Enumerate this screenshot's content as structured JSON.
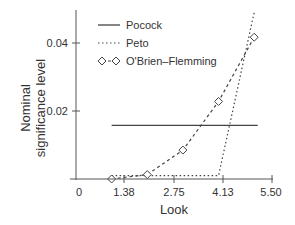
{
  "chart_data": {
    "type": "line",
    "title": "",
    "xlabel": "Look",
    "ylabel": "Nominal significance level",
    "ylabel_lines": [
      "Nominal",
      "significance level"
    ],
    "xlim": [
      0,
      5.5
    ],
    "ylim": [
      0,
      0.05
    ],
    "x_ticks": [
      0,
      1.375,
      2.75,
      4.125,
      5.5
    ],
    "x_tick_labels": [
      "0",
      "1.38",
      "2.75",
      "4.13",
      "5.50"
    ],
    "y_ticks": [
      0.02,
      0.04
    ],
    "y_tick_labels": [
      "0.02",
      "0.04"
    ],
    "grid": false,
    "legend_position": "upper-left-inside",
    "x": [
      1,
      2,
      3,
      4,
      5
    ],
    "series": [
      {
        "name": "Pocock",
        "style": "solid",
        "marker": "none",
        "values": [
          0.0158,
          0.0158,
          0.0158,
          0.0158,
          0.0158
        ]
      },
      {
        "name": "Peto",
        "style": "dotted",
        "marker": "none",
        "values": [
          0.001,
          0.001,
          0.001,
          0.001,
          0.049
        ]
      },
      {
        "name": "O'Brien–Flemming",
        "style": "dashed",
        "marker": "diamond",
        "values": [
          5e-06,
          0.0013,
          0.0085,
          0.0228,
          0.0417
        ]
      }
    ]
  },
  "legend": {
    "items": [
      {
        "label": "Pocock"
      },
      {
        "label": "Peto"
      },
      {
        "label": "O'Brien–Flemming"
      }
    ]
  },
  "axes": {
    "xlabel": "Look",
    "ylabel_line1": "Nominal",
    "ylabel_line2": "significance level",
    "x_tick_labels": [
      "0",
      "1.38",
      "2.75",
      "4.13",
      "5.50"
    ],
    "y_tick_labels": [
      "0.02",
      "0.04"
    ]
  },
  "colors": {
    "axis": "#555555",
    "line": "#444444",
    "text": "#333333",
    "background": "#ffffff"
  }
}
